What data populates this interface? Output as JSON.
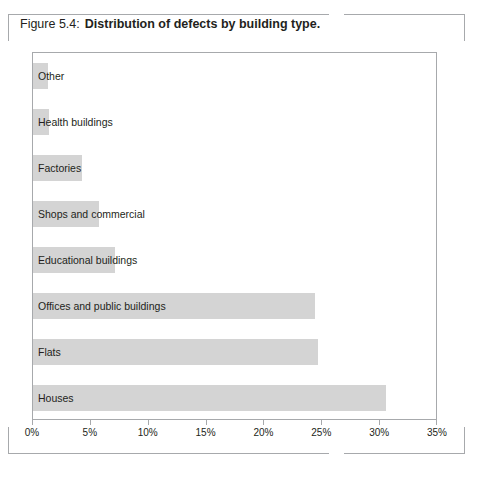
{
  "caption": {
    "number": "Figure 5.4:",
    "title": "Distribution of defects by building type."
  },
  "chart_data": {
    "type": "bar",
    "orientation": "horizontal",
    "title": "Distribution of defects by building type.",
    "xlabel": "",
    "ylabel": "",
    "xlim": [
      0,
      35
    ],
    "grid": false,
    "legend": null,
    "bar_color": "#d4d4d4",
    "axis_color": "#a7a9ac",
    "tick_labels": [
      "0%",
      "5%",
      "10%",
      "15%",
      "20%",
      "25%",
      "30%",
      "35%"
    ],
    "tick_values": [
      0,
      5,
      10,
      15,
      20,
      25,
      30,
      35
    ],
    "categories": [
      "Other",
      "Health buildings",
      "Factories",
      "Shops and commercial",
      "Educational buildings",
      "Offices and public buildings",
      "Flats",
      "Houses"
    ],
    "values": [
      1.3,
      1.4,
      4.2,
      5.7,
      7.1,
      24.4,
      24.6,
      30.5
    ]
  }
}
